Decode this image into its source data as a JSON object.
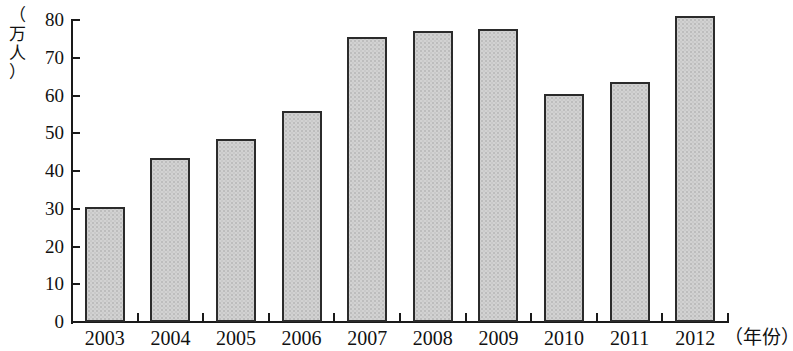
{
  "chart_data": {
    "type": "bar",
    "title": "",
    "subtitle": "",
    "xlabel": "（年份）",
    "ylabel": "（万人）",
    "categories": [
      "2003",
      "2004",
      "2005",
      "2006",
      "2007",
      "2008",
      "2009",
      "2010",
      "2011",
      "2012"
    ],
    "values": [
      30.5,
      43.5,
      48.5,
      56,
      75.5,
      77,
      77.5,
      60.5,
      63.5,
      81
    ],
    "ylim": [
      0,
      80
    ],
    "ytick_labels": [
      "0",
      "10",
      "20",
      "30",
      "40",
      "50",
      "60",
      "70",
      "80"
    ],
    "ytick_values": [
      0,
      10,
      20,
      30,
      40,
      50,
      60,
      70,
      80
    ],
    "grid": false,
    "legend": null,
    "legend_position": "none",
    "bar_fill_color": "#d2d2d2",
    "bar_border_color": "#2b2b2b",
    "axis_color": "#1a1a1a",
    "background_color": "#ffffff"
  },
  "axis": {
    "y_unit_chars": [
      "（",
      "万",
      "人",
      "）"
    ],
    "x_unit": "（年份）"
  }
}
